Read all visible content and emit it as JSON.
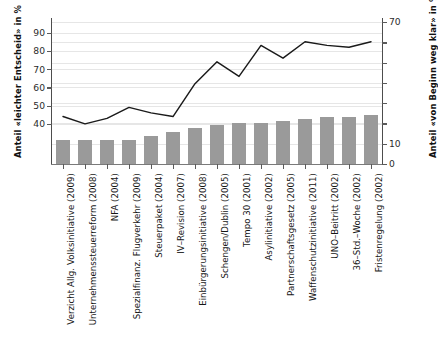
{
  "chart_data": {
    "type": "bar",
    "title": "",
    "subtitle": "",
    "categories": [
      "Verzicht Allg. Volksinitiative (2009)",
      "Unternehmenssteuerreform (2008)",
      "NFA (2004)",
      "Spezialfinanz. Flugverkehr (2009)",
      "Steuerpaket (2004)",
      "IV–Revision (2007)",
      "Einbürgerungsinitiative (2008)",
      "Schengen/Dublin (2005)",
      "Tempo 30 (2001)",
      "Asylinitiative (2002)",
      "Partnerschaftsgesetz (2005)",
      "Waffenschutzinitiative (2011)",
      "UNO–Beitritt (2002)",
      "36–Std.–Woche (2002)",
      "Fristenregelung (2002)"
    ],
    "series": [
      {
        "name": "Anteil «von Beginn weg klar» in %",
        "kind": "bar",
        "axis": "right",
        "color": "#9a9a9a",
        "values": [
          12,
          12,
          12,
          12,
          14,
          16,
          18,
          19,
          20,
          20,
          21,
          22,
          23,
          23,
          24
        ]
      },
      {
        "name": "Anteil «leichter Entscheid» in %",
        "kind": "line",
        "axis": "left",
        "color": "#1a1a1a",
        "values": [
          44,
          40,
          43,
          49,
          46,
          44,
          62,
          74,
          66,
          83,
          76,
          85,
          83,
          82,
          85
        ]
      }
    ],
    "xlabel": "",
    "ylabel_left": "Anteil «leichter Entscheid» in %",
    "ylabel_right": "Anteil «von Beginn weg klar» in %",
    "ylim_left": [
      18,
      98
    ],
    "ylim_right": [
      0,
      72
    ],
    "yticks_left": [
      40,
      50,
      60,
      70,
      80,
      90
    ],
    "yticks_left_labels": [
      "40",
      "50",
      "60",
      "70",
      "80",
      "90"
    ],
    "yticks_right": [
      0,
      10,
      20,
      30,
      40,
      50,
      60,
      70
    ],
    "yticks_right_labels": [
      "0",
      "10",
      "",
      "",
      "",
      "",
      "",
      "70"
    ],
    "grid": true,
    "legend": "none"
  },
  "axes": {
    "left_title": "Anteil «leichter Entscheid» in %",
    "right_title": "Anteil «von Beginn weg klar» in %"
  }
}
